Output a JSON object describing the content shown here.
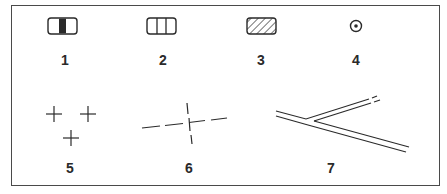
{
  "legend": {
    "items": [
      {
        "id": 1,
        "label": "1",
        "symbol": "rounded-rect-solid-center-bar"
      },
      {
        "id": 2,
        "label": "2",
        "symbol": "rounded-rect-two-dividers"
      },
      {
        "id": 3,
        "label": "3",
        "symbol": "rounded-rect-hatched"
      },
      {
        "id": 4,
        "label": "4",
        "symbol": "circle-with-dot"
      },
      {
        "id": 5,
        "label": "5",
        "symbol": "three-crosses"
      },
      {
        "id": 6,
        "label": "6",
        "symbol": "dashed-cross"
      },
      {
        "id": 7,
        "label": "7",
        "symbol": "double-line-road-fork"
      }
    ]
  },
  "colors": {
    "ink": "#2a2a2a",
    "frame": "#4a4a4a",
    "background": "#ffffff"
  }
}
